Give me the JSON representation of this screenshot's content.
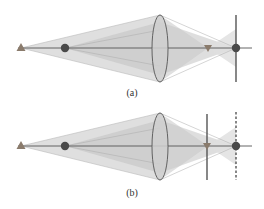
{
  "figure": {
    "panels": [
      {
        "id": "a",
        "caption": "(a)",
        "detector_line_style": "solid",
        "detector_position": "at point-image focus"
      },
      {
        "id": "b",
        "caption": "(b)",
        "detector_line_style": "solid at triangle image, dashed at point image",
        "detector_position": "at triangle-image focus"
      }
    ],
    "elements": {
      "triangle_source": "triangle-icon",
      "point_source": "circle-icon",
      "lens": "biconvex-lens",
      "triangle_image": "inverted-triangle-icon",
      "point_image": "circle-icon"
    },
    "colors": {
      "triangle": "#8a7b6c",
      "circle": "#4a4a4a",
      "axis": "#555555",
      "cone_light": "#d8d8d8",
      "cone_dark": "#c4c4c4",
      "lens_fill": "#d0d0d0",
      "lens_stroke": "#555555",
      "detector": "#555555"
    }
  }
}
